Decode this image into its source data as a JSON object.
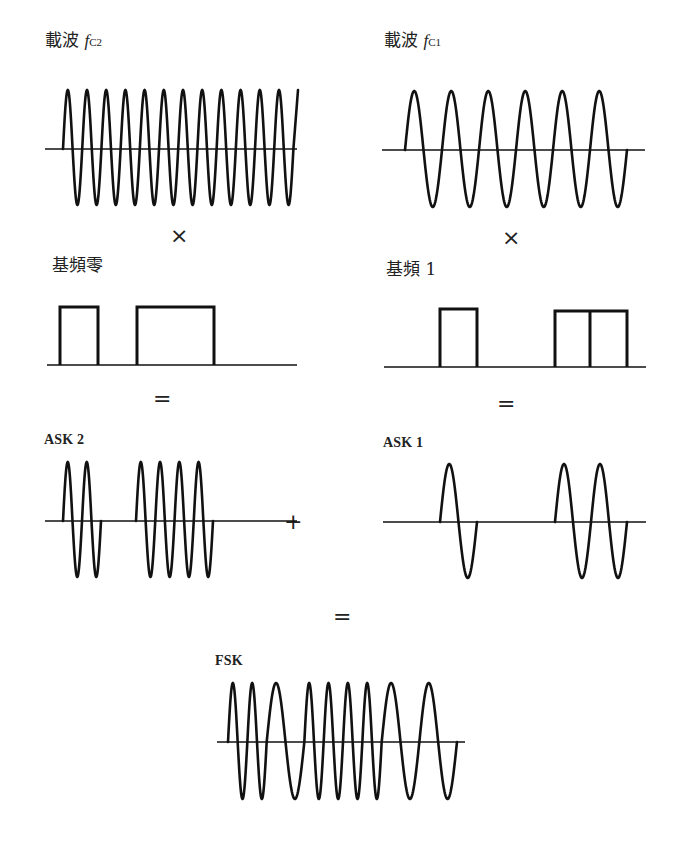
{
  "figure": {
    "panels": {
      "carrier_fc2": {
        "label_cjk": "載波",
        "label_f": "f",
        "label_sub": "C2",
        "periods": 12,
        "relative_frequency": "high"
      },
      "carrier_fc1": {
        "label_cjk": "載波",
        "label_f": "f",
        "label_sub": "C1",
        "periods": 6,
        "relative_frequency": "low"
      },
      "baseband_zero": {
        "label": "基頻零",
        "bits": [
          1,
          0,
          1,
          1,
          0,
          0
        ]
      },
      "baseband_one": {
        "label": "基頻 1",
        "bits": [
          0,
          1,
          0,
          0,
          1,
          1
        ]
      },
      "ask2": {
        "label": "ASK 2",
        "bursts_periods": [
          2,
          4
        ]
      },
      "ask1": {
        "label": "ASK 1",
        "bursts_periods": [
          1,
          2
        ]
      },
      "fsk": {
        "label": "FSK"
      }
    },
    "operators": {
      "multiply_left": "×",
      "multiply_right": "×",
      "equals_left": "=",
      "equals_right": "=",
      "plus": "+",
      "equals_bottom": "="
    }
  }
}
